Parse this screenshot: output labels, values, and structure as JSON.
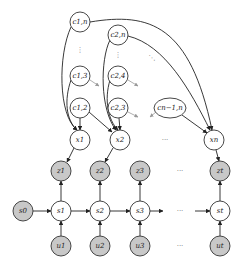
{
  "diagram": {
    "type": "graphical-model",
    "nodes": {
      "c_1n": {
        "label": "c1,n",
        "shaded": false
      },
      "c_2n": {
        "label": "c2,n",
        "shaded": false
      },
      "c_13": {
        "label": "c1,3",
        "shaded": false
      },
      "c_12": {
        "label": "c1,2",
        "shaded": false
      },
      "c_24": {
        "label": "c2,4",
        "shaded": false
      },
      "c_23": {
        "label": "c2,3",
        "shaded": false
      },
      "c_n1n": {
        "label": "cn−1,n",
        "shaded": false
      },
      "x_1": {
        "label": "x1",
        "shaded": false
      },
      "x_2": {
        "label": "x2",
        "shaded": false
      },
      "x_n": {
        "label": "xn",
        "shaded": false
      },
      "z_1": {
        "label": "z1",
        "shaded": true
      },
      "z_2": {
        "label": "z2",
        "shaded": true
      },
      "z_3": {
        "label": "z3",
        "shaded": true
      },
      "z_t": {
        "label": "zt",
        "shaded": true
      },
      "s_0": {
        "label": "s0",
        "shaded": true
      },
      "s_1": {
        "label": "s1",
        "shaded": false
      },
      "s_2": {
        "label": "s2",
        "shaded": false
      },
      "s_3": {
        "label": "s3",
        "shaded": false
      },
      "s_t": {
        "label": "st",
        "shaded": false
      },
      "u_1": {
        "label": "u1",
        "shaded": true
      },
      "u_2": {
        "label": "u2",
        "shaded": true
      },
      "u_3": {
        "label": "u3",
        "shaded": true
      },
      "u_t": {
        "label": "ut",
        "shaded": true
      }
    },
    "ellipsis": {
      "vertical": "⋮",
      "diagonal": "⋱",
      "horizontal": "···"
    },
    "edges": [
      [
        "c_1n",
        "x_1"
      ],
      [
        "c_1n",
        "x_n"
      ],
      [
        "c_13",
        "x_1"
      ],
      [
        "c_12",
        "x_1"
      ],
      [
        "c_12",
        "x_2"
      ],
      [
        "c_2n",
        "x_2"
      ],
      [
        "c_2n",
        "x_n"
      ],
      [
        "c_24",
        "x_2"
      ],
      [
        "c_23",
        "x_2"
      ],
      [
        "c_n1n",
        "x_n"
      ],
      [
        "x_1",
        "z_1"
      ],
      [
        "x_2",
        "z_2"
      ],
      [
        "x_n",
        "z_t"
      ],
      [
        "s_0",
        "s_1"
      ],
      [
        "s_1",
        "s_2"
      ],
      [
        "s_2",
        "s_3"
      ],
      [
        "s_3",
        "s_t"
      ],
      [
        "s_1",
        "z_1"
      ],
      [
        "s_2",
        "z_2"
      ],
      [
        "s_3",
        "z_3"
      ],
      [
        "s_t",
        "z_t"
      ],
      [
        "u_1",
        "s_1"
      ],
      [
        "u_2",
        "s_2"
      ],
      [
        "u_3",
        "s_3"
      ],
      [
        "u_t",
        "s_t"
      ]
    ]
  }
}
